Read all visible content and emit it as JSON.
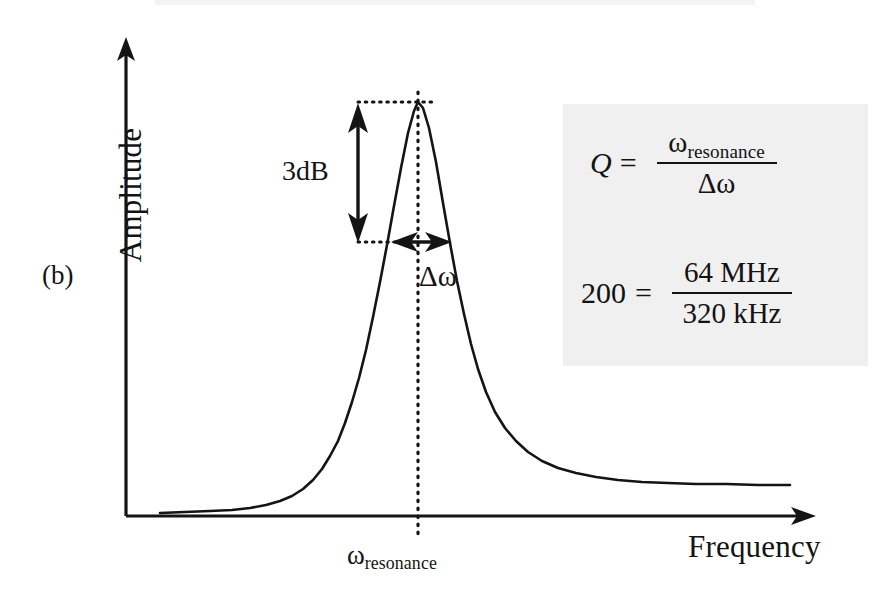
{
  "figure": {
    "panel_label": "(b)",
    "background_color": "#ffffff",
    "curve_color": "#141414",
    "panel_background": "#f0f0f0"
  },
  "axes": {
    "y_label": "Amplitude",
    "x_label": "Frequency",
    "origin": {
      "x": 126,
      "y": 516
    },
    "y_arrow_tip": {
      "x": 126,
      "y": 37
    },
    "x_arrow_tip": {
      "x": 816,
      "y": 516
    }
  },
  "annotations": {
    "bandwidth_label": "3dB",
    "delta_omega_label": "Δω",
    "resonance_base": "ω",
    "resonance_sub": "resonance"
  },
  "formulas": {
    "definition": {
      "lhs": "Q",
      "equals": "=",
      "numerator_base": "ω",
      "numerator_sub": "resonance",
      "denominator": "Δω"
    },
    "numeric": {
      "lhs": "200",
      "equals": "=",
      "numerator": "64 MHz",
      "denominator": "320 kHz"
    }
  },
  "chart_data": {
    "type": "line",
    "title": "",
    "xlabel": "Frequency",
    "ylabel": "Amplitude",
    "grid": false,
    "legend": null,
    "peak": {
      "x_px": 418,
      "y_px": 102
    },
    "half_power_level_px": 242,
    "baseline_px": 516,
    "fwhm_px": {
      "left": 392,
      "right": 450
    },
    "resonance_x_px": 418,
    "annotations": {
      "three_db_arrow": {
        "x_px": 358,
        "y_top_px": 103,
        "y_bottom_px": 242
      },
      "delta_omega_arrow": {
        "y_px": 242,
        "x_left_px": 392,
        "x_right_px": 450
      },
      "dotted_top_line": {
        "y_px": 102,
        "x_from_px": 358,
        "x_to_px": 430
      },
      "dotted_bottom_line": {
        "y_px": 242,
        "x_from_px": 358,
        "x_to_px": 394
      },
      "vertical_dotted_line": {
        "x_px": 418,
        "y_from_px": 92,
        "y_to_px": 540
      }
    },
    "curve_points_px": [
      [
        160,
        513
      ],
      [
        185,
        512
      ],
      [
        210,
        511
      ],
      [
        232,
        510
      ],
      [
        250,
        508
      ],
      [
        266,
        505
      ],
      [
        280,
        501
      ],
      [
        292,
        496
      ],
      [
        303,
        489
      ],
      [
        313,
        480
      ],
      [
        322,
        469
      ],
      [
        330,
        456
      ],
      [
        338,
        441
      ],
      [
        345,
        423
      ],
      [
        352,
        402
      ],
      [
        359,
        378
      ],
      [
        366,
        350
      ],
      [
        373,
        317
      ],
      [
        380,
        282
      ],
      [
        387,
        245
      ],
      [
        394,
        206
      ],
      [
        401,
        168
      ],
      [
        408,
        133
      ],
      [
        414,
        111
      ],
      [
        418,
        102
      ],
      [
        423,
        108
      ],
      [
        429,
        128
      ],
      [
        436,
        162
      ],
      [
        443,
        203
      ],
      [
        450,
        243
      ],
      [
        457,
        281
      ],
      [
        464,
        314
      ],
      [
        471,
        344
      ],
      [
        478,
        369
      ],
      [
        486,
        392
      ],
      [
        495,
        412
      ],
      [
        505,
        428
      ],
      [
        516,
        441
      ],
      [
        528,
        452
      ],
      [
        542,
        461
      ],
      [
        558,
        468
      ],
      [
        576,
        473
      ],
      [
        596,
        477
      ],
      [
        618,
        480
      ],
      [
        642,
        482
      ],
      [
        668,
        483
      ],
      [
        696,
        484
      ],
      [
        726,
        484
      ],
      [
        758,
        485
      ],
      [
        790,
        485
      ]
    ]
  }
}
